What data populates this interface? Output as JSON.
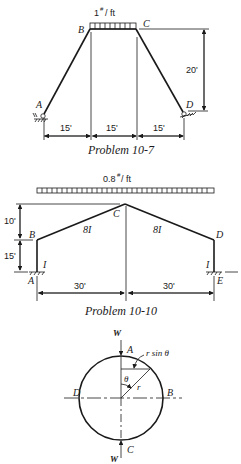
{
  "figures": [
    {
      "caption": "Problem 10-7",
      "load_label": "1#/ft",
      "load_value": "1",
      "load_unit": "/ ft",
      "load_superscript": "#",
      "nodes": [
        "A",
        "B",
        "C",
        "D"
      ],
      "dimensions": {
        "spans": [
          "15'",
          "15'",
          "15'"
        ],
        "height": "20'"
      }
    },
    {
      "caption": "Problem 10-10",
      "load_value": "0.8",
      "load_unit": "/ ft",
      "load_superscript": "#",
      "nodes": [
        "A",
        "B",
        "C",
        "D",
        "E"
      ],
      "members": {
        "rafter_left": "8I",
        "rafter_right": "8I",
        "col_left": "I",
        "col_right": "I"
      },
      "dimensions": {
        "rise": "10'",
        "col_height": "15'",
        "spans": [
          "30'",
          "30'"
        ]
      }
    },
    {
      "caption": "",
      "nodes": [
        "A",
        "B",
        "C",
        "D"
      ],
      "loads": [
        "W",
        "W"
      ],
      "labels": {
        "rsin": "r sin θ",
        "theta": "θ",
        "radius": "r"
      }
    }
  ]
}
